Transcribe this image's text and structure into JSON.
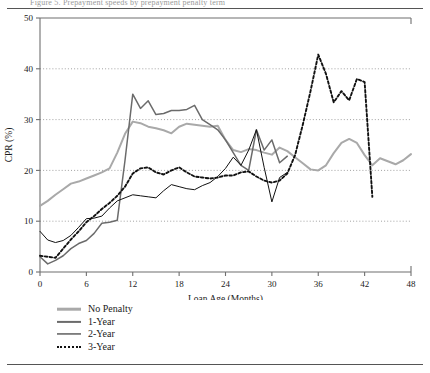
{
  "page": {
    "clipped_header_text": "Figure 5. Prepayment speeds by prepayment penalty term",
    "background": "#ffffff"
  },
  "chart_data": {
    "type": "line",
    "title": "",
    "xlabel": "Loan Age (Months)",
    "ylabel": "CPR (%)",
    "xlim": [
      0,
      48
    ],
    "ylim": [
      0,
      50
    ],
    "xticks": [
      0,
      6,
      12,
      18,
      24,
      30,
      36,
      42,
      48
    ],
    "yticks": [
      0,
      10,
      20,
      30,
      40,
      50
    ],
    "grid": "horizontal-dotted",
    "legend_position": "below-plot-left",
    "colors": {
      "no_penalty": "#a9a9a9",
      "one_year": "#6b6b6b",
      "two_year": "#111111",
      "three_year": "#111111",
      "grid": "#8a8a8a",
      "axis": "#6f6f6f"
    },
    "series": [
      {
        "name": "No Penalty",
        "style": "solid-thick-lightgray",
        "x": [
          0,
          1,
          2,
          3,
          4,
          5,
          6,
          7,
          8,
          9,
          10,
          11,
          12,
          13,
          14,
          15,
          16,
          17,
          18,
          19,
          20,
          21,
          22,
          23,
          24,
          25,
          26,
          27,
          28,
          29,
          30,
          31,
          32,
          33,
          34,
          35,
          36,
          37,
          38,
          39,
          40,
          41,
          42,
          43,
          44,
          45,
          46,
          47,
          48
        ],
        "values": [
          13.0,
          14.0,
          15.2,
          16.3,
          17.4,
          17.8,
          18.4,
          19.0,
          19.6,
          20.4,
          23.5,
          27.2,
          29.6,
          29.3,
          28.6,
          28.3,
          27.9,
          27.3,
          28.6,
          29.2,
          29.0,
          28.8,
          28.6,
          28.8,
          26.0,
          24.0,
          23.6,
          24.2,
          24.0,
          23.5,
          23.1,
          24.5,
          23.8,
          22.6,
          21.4,
          20.2,
          20.0,
          21.0,
          23.4,
          25.4,
          26.2,
          25.4,
          23.0,
          21.0,
          22.4,
          21.8,
          21.2,
          22.0,
          23.2
        ]
      },
      {
        "name": "1-Year",
        "style": "solid-medium-gray",
        "x": [
          0,
          1,
          2,
          3,
          4,
          5,
          6,
          7,
          8,
          9,
          10,
          11,
          12,
          13,
          14,
          15,
          16,
          17,
          18,
          19,
          20,
          21,
          22,
          23,
          24,
          25,
          26,
          27,
          28,
          29,
          30,
          31,
          32
        ],
        "values": [
          3.0,
          1.6,
          2.3,
          3.2,
          4.6,
          5.6,
          6.2,
          7.6,
          9.6,
          9.8,
          10.2,
          22.0,
          35.0,
          32.2,
          33.7,
          31.0,
          31.2,
          31.8,
          31.8,
          32.0,
          32.8,
          30.0,
          29.0,
          28.0,
          26.0,
          23.5,
          21.0,
          20.0,
          28.0,
          24.0,
          26.0,
          21.5,
          22.8
        ]
      },
      {
        "name": "2-Year",
        "style": "solid-thin-black",
        "x": [
          0,
          1,
          2,
          3,
          4,
          5,
          6,
          7,
          8,
          9,
          10,
          11,
          12,
          13,
          14,
          15,
          16,
          17,
          18,
          19,
          20,
          21,
          22,
          23,
          24,
          25,
          26,
          27,
          28,
          29,
          30,
          31,
          32
        ],
        "values": [
          8.0,
          6.3,
          5.8,
          6.2,
          7.2,
          8.8,
          10.5,
          10.6,
          11.0,
          12.6,
          14.0,
          14.6,
          15.2,
          15.0,
          14.8,
          14.6,
          16.0,
          17.2,
          16.8,
          16.4,
          16.2,
          17.0,
          17.6,
          18.8,
          20.4,
          22.6,
          21.0,
          24.0,
          28.0,
          20.6,
          13.8,
          18.6,
          19.6
        ]
      },
      {
        "name": "3-Year",
        "style": "dotted-black",
        "x": [
          0,
          1,
          2,
          3,
          4,
          5,
          6,
          7,
          8,
          9,
          10,
          11,
          12,
          13,
          14,
          15,
          16,
          17,
          18,
          19,
          20,
          21,
          22,
          23,
          24,
          25,
          26,
          27,
          28,
          29,
          30,
          31,
          32,
          33,
          34,
          35,
          36,
          37,
          38,
          39,
          40,
          41,
          42,
          43
        ],
        "values": [
          3.2,
          3.0,
          2.8,
          4.6,
          6.4,
          8.0,
          9.8,
          11.0,
          12.4,
          13.6,
          15.0,
          16.8,
          19.4,
          20.4,
          20.6,
          19.6,
          19.2,
          20.0,
          20.6,
          19.6,
          18.8,
          18.6,
          18.4,
          18.6,
          19.0,
          19.0,
          19.6,
          19.8,
          18.8,
          18.0,
          17.6,
          18.0,
          19.4,
          23.0,
          29.0,
          35.6,
          42.8,
          39.0,
          33.4,
          35.6,
          33.8,
          38.0,
          37.4,
          14.8
        ]
      }
    ]
  },
  "axis": {
    "x_tick_labels": [
      "0",
      "6",
      "12",
      "18",
      "24",
      "30",
      "36",
      "42",
      "48"
    ],
    "y_tick_labels": [
      "0",
      "10",
      "20",
      "30",
      "40",
      "50"
    ],
    "x_title": "Loan Age (Months)",
    "y_title": "CPR (%)"
  },
  "legend": {
    "items": [
      {
        "label": "No Penalty",
        "swatch": "line-swatch-no-penalty"
      },
      {
        "label": "1-Year",
        "swatch": "line-swatch-1-year"
      },
      {
        "label": "2-Year",
        "swatch": "line-swatch-2-year"
      },
      {
        "label": "3-Year",
        "swatch": "line-swatch-3-year"
      }
    ]
  }
}
